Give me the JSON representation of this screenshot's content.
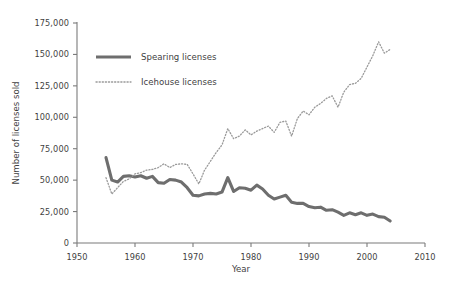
{
  "chart_data": {
    "type": "line",
    "title": "",
    "xlabel": "Year",
    "ylabel": "Number of licenses sold",
    "xlim": [
      1950,
      2010
    ],
    "ylim": [
      0,
      175000
    ],
    "xticks": [
      1950,
      1960,
      1970,
      1980,
      1990,
      2000,
      2010
    ],
    "xtick_labels": [
      "1950",
      "1960",
      "1970",
      "1980",
      "1990",
      "2000",
      "2010"
    ],
    "yticks": [
      0,
      25000,
      50000,
      75000,
      100000,
      125000,
      150000,
      175000
    ],
    "ytick_labels": [
      "0",
      "25,000",
      "50,000",
      "75,000",
      "100,000",
      "125,000",
      "150,000",
      "175,000"
    ],
    "grid": false,
    "legend_position": "upper-left-inside",
    "x": [
      1955,
      1956,
      1957,
      1958,
      1959,
      1960,
      1961,
      1962,
      1963,
      1964,
      1965,
      1966,
      1967,
      1968,
      1969,
      1970,
      1971,
      1972,
      1973,
      1974,
      1975,
      1976,
      1977,
      1978,
      1979,
      1980,
      1981,
      1982,
      1983,
      1984,
      1985,
      1986,
      1987,
      1988,
      1989,
      1990,
      1991,
      1992,
      1993,
      1994,
      1995,
      1996,
      1997,
      1998,
      1999,
      2000,
      2001,
      2002,
      2003,
      2004
    ],
    "series": [
      {
        "name": "Spearing licenses",
        "style": "solid",
        "color": "#6e6e6e",
        "values": [
          68000,
          50000,
          48500,
          53000,
          53500,
          52500,
          53500,
          51500,
          53000,
          48000,
          47500,
          50500,
          50000,
          48500,
          44000,
          38000,
          37500,
          39000,
          39500,
          39000,
          40500,
          52000,
          41000,
          44000,
          43500,
          42000,
          46000,
          43000,
          38000,
          35000,
          36500,
          38000,
          32500,
          31500,
          31500,
          29000,
          28000,
          28500,
          26000,
          26500,
          24500,
          22000,
          24000,
          22500,
          24000,
          22000,
          23000,
          21000,
          20500,
          17500
        ]
      },
      {
        "name": "Icehouse licenses",
        "style": "dotted",
        "color": "#9a9a9a",
        "values": [
          52000,
          39000,
          44000,
          49000,
          51000,
          55000,
          56000,
          58000,
          58500,
          60000,
          63000,
          60000,
          62500,
          63000,
          62500,
          55000,
          47000,
          58000,
          65000,
          72000,
          78000,
          91000,
          83000,
          85000,
          90000,
          86000,
          89000,
          91000,
          93000,
          88000,
          96000,
          97000,
          85000,
          99000,
          105000,
          102000,
          108000,
          111000,
          115000,
          117000,
          108000,
          120000,
          126000,
          127000,
          131000,
          140000,
          149000,
          160000,
          151000,
          154000
        ]
      }
    ]
  },
  "legend": {
    "items": [
      {
        "label": "Spearing licenses"
      },
      {
        "label": "Icehouse licenses"
      }
    ]
  }
}
